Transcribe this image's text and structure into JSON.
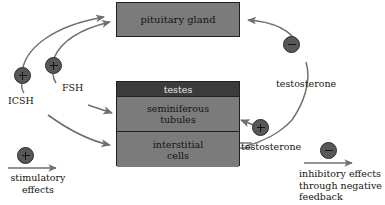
{
  "diagram": {
    "title_visible": false,
    "colors": {
      "box_fill": "#7b7b7b",
      "testes_band_fill": "#3b3b3b",
      "box_border": "#231f20",
      "circle_fill": "#58585a",
      "arrow_stroke": "#6f6f6f",
      "text": "#17140f",
      "background": "#ffffff"
    },
    "boxes": [
      {
        "id": "pituitary",
        "label": "pituitary gland"
      },
      {
        "id": "testes",
        "label": "testes"
      },
      {
        "id": "seminiferous",
        "label": "seminiferous\ntubules",
        "line1": "seminiferous",
        "line2": "tubules"
      },
      {
        "id": "interstitial",
        "label": "interstitial\ncells",
        "line1": "interstitial",
        "line2": "cells"
      }
    ],
    "hormones": [
      {
        "id": "icsh",
        "label": "ICSH",
        "sign": "+"
      },
      {
        "id": "fsh",
        "label": "FSH",
        "sign": "+"
      },
      {
        "id": "testosterone-feedback",
        "label": "testosterone",
        "sign": "−"
      },
      {
        "id": "testosterone-local",
        "label": "testosterone",
        "sign": "+"
      }
    ],
    "signs": {
      "plus": "+",
      "minus": "−"
    },
    "legend": {
      "stimulatory": {
        "sign": "+",
        "line1": "stimulatory",
        "line2": "effects"
      },
      "inhibitory": {
        "sign": "−",
        "line1": "inhibitory effects",
        "line2": "through negative",
        "line3": "feedback"
      }
    }
  }
}
